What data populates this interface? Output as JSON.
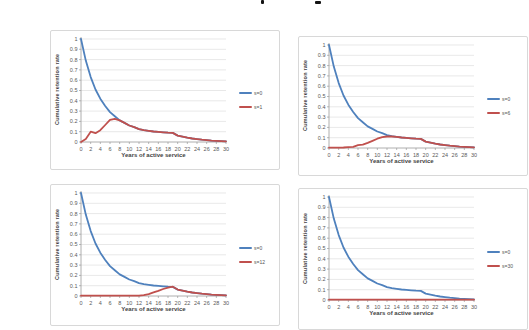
{
  "accent_colors": {
    "series1_blue": "#4F81BD",
    "series2_red": "#C0504D",
    "gridline": "#D9D9D9",
    "axis": "#9B9B9B",
    "tick_text": "#595959"
  },
  "chart_data": [
    {
      "type": "line",
      "title": "",
      "xlabel": "Years of active service",
      "ylabel": "Cumulative retention rate",
      "xlim": [
        0,
        30
      ],
      "ylim": [
        0,
        1
      ],
      "xtick_step": 2,
      "ytick_step": 0.1,
      "grid": "horizontal",
      "legend_position": "right",
      "x": [
        0,
        1,
        2,
        3,
        4,
        5,
        6,
        7,
        8,
        9,
        10,
        11,
        12,
        13,
        14,
        15,
        16,
        17,
        18,
        19,
        20,
        21,
        22,
        23,
        24,
        25,
        26,
        27,
        28,
        29,
        30
      ],
      "series": [
        {
          "name": "s=0",
          "color": "#4F81BD",
          "values": [
            1.0,
            0.79,
            0.63,
            0.51,
            0.42,
            0.35,
            0.29,
            0.25,
            0.21,
            0.185,
            0.16,
            0.145,
            0.125,
            0.115,
            0.108,
            0.102,
            0.098,
            0.094,
            0.09,
            0.088,
            0.062,
            0.052,
            0.042,
            0.034,
            0.028,
            0.022,
            0.018,
            0.014,
            0.011,
            0.009,
            0.007
          ]
        },
        {
          "name": "s=1",
          "color": "#C0504D",
          "values": [
            0,
            0.03,
            0.1,
            0.085,
            0.115,
            0.165,
            0.215,
            0.225,
            0.21,
            0.185,
            0.16,
            0.145,
            0.125,
            0.115,
            0.108,
            0.102,
            0.098,
            0.094,
            0.09,
            0.088,
            0.062,
            0.052,
            0.042,
            0.034,
            0.028,
            0.022,
            0.018,
            0.014,
            0.011,
            0.009,
            0.007
          ]
        }
      ]
    },
    {
      "type": "line",
      "title": "",
      "xlabel": "Years of active service",
      "ylabel": "Cumulative retention rate",
      "xlim": [
        0,
        30
      ],
      "ylim": [
        0,
        1
      ],
      "xtick_step": 2,
      "ytick_step": 0.1,
      "grid": "horizontal",
      "legend_position": "right",
      "x": [
        0,
        1,
        2,
        3,
        4,
        5,
        6,
        7,
        8,
        9,
        10,
        11,
        12,
        13,
        14,
        15,
        16,
        17,
        18,
        19,
        20,
        21,
        22,
        23,
        24,
        25,
        26,
        27,
        28,
        29,
        30
      ],
      "series": [
        {
          "name": "s=0",
          "color": "#4F81BD",
          "values": [
            1.0,
            0.79,
            0.63,
            0.51,
            0.42,
            0.35,
            0.29,
            0.25,
            0.21,
            0.185,
            0.16,
            0.145,
            0.125,
            0.115,
            0.108,
            0.102,
            0.098,
            0.094,
            0.09,
            0.088,
            0.062,
            0.052,
            0.042,
            0.034,
            0.028,
            0.022,
            0.018,
            0.014,
            0.011,
            0.009,
            0.007
          ]
        },
        {
          "name": "s=6",
          "color": "#C0504D",
          "values": [
            0.003,
            0.003,
            0.004,
            0.005,
            0.008,
            0.012,
            0.028,
            0.032,
            0.05,
            0.07,
            0.09,
            0.105,
            0.112,
            0.112,
            0.108,
            0.102,
            0.098,
            0.094,
            0.09,
            0.088,
            0.062,
            0.052,
            0.042,
            0.034,
            0.028,
            0.022,
            0.018,
            0.014,
            0.011,
            0.009,
            0.007
          ]
        }
      ]
    },
    {
      "type": "line",
      "title": "",
      "xlabel": "Years of active service",
      "ylabel": "Cumulative retention rate",
      "xlim": [
        0,
        30
      ],
      "ylim": [
        0,
        1
      ],
      "xtick_step": 2,
      "ytick_step": 0.1,
      "grid": "horizontal",
      "legend_position": "right",
      "x": [
        0,
        1,
        2,
        3,
        4,
        5,
        6,
        7,
        8,
        9,
        10,
        11,
        12,
        13,
        14,
        15,
        16,
        17,
        18,
        19,
        20,
        21,
        22,
        23,
        24,
        25,
        26,
        27,
        28,
        29,
        30
      ],
      "series": [
        {
          "name": "s=0",
          "color": "#4F81BD",
          "values": [
            1.0,
            0.79,
            0.63,
            0.51,
            0.42,
            0.35,
            0.29,
            0.25,
            0.21,
            0.185,
            0.16,
            0.145,
            0.125,
            0.115,
            0.108,
            0.102,
            0.098,
            0.094,
            0.09,
            0.088,
            0.062,
            0.052,
            0.042,
            0.034,
            0.028,
            0.022,
            0.018,
            0.014,
            0.011,
            0.009,
            0.007
          ]
        },
        {
          "name": "s=12",
          "color": "#C0504D",
          "values": [
            0.003,
            0.003,
            0.003,
            0.003,
            0.003,
            0.003,
            0.003,
            0.003,
            0.003,
            0.003,
            0.003,
            0.003,
            0.003,
            0.008,
            0.018,
            0.035,
            0.05,
            0.068,
            0.082,
            0.09,
            0.062,
            0.052,
            0.042,
            0.034,
            0.028,
            0.022,
            0.018,
            0.014,
            0.011,
            0.009,
            0.007
          ]
        }
      ]
    },
    {
      "type": "line",
      "title": "",
      "xlabel": "Years of active service",
      "ylabel": "Cumulative retention rate",
      "xlim": [
        0,
        30
      ],
      "ylim": [
        0,
        1
      ],
      "xtick_step": 2,
      "ytick_step": 0.1,
      "grid": "horizontal",
      "legend_position": "right",
      "x": [
        0,
        1,
        2,
        3,
        4,
        5,
        6,
        7,
        8,
        9,
        10,
        11,
        12,
        13,
        14,
        15,
        16,
        17,
        18,
        19,
        20,
        21,
        22,
        23,
        24,
        25,
        26,
        27,
        28,
        29,
        30
      ],
      "series": [
        {
          "name": "s=0",
          "color": "#4F81BD",
          "values": [
            1.0,
            0.79,
            0.63,
            0.51,
            0.42,
            0.35,
            0.29,
            0.25,
            0.21,
            0.185,
            0.16,
            0.145,
            0.125,
            0.115,
            0.108,
            0.102,
            0.098,
            0.094,
            0.09,
            0.088,
            0.062,
            0.052,
            0.042,
            0.034,
            0.028,
            0.022,
            0.018,
            0.014,
            0.011,
            0.009,
            0.007
          ]
        },
        {
          "name": "s=30",
          "color": "#C0504D",
          "values": [
            0.003,
            0.003,
            0.003,
            0.003,
            0.003,
            0.003,
            0.003,
            0.003,
            0.003,
            0.003,
            0.003,
            0.003,
            0.003,
            0.003,
            0.003,
            0.003,
            0.003,
            0.003,
            0.003,
            0.003,
            0.003,
            0.003,
            0.003,
            0.003,
            0.003,
            0.003,
            0.003,
            0.003,
            0.003,
            0.003,
            0.003
          ]
        }
      ]
    }
  ]
}
